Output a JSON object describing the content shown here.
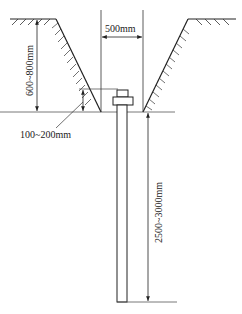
{
  "diagram": {
    "type": "trench-with-pile-cross-section",
    "dimensions": {
      "trench_width": "500mm",
      "trench_depth": "600~800mm",
      "cap_height_above_bottom": "100~200mm",
      "pile_length": "2500~3000mm"
    },
    "colors": {
      "line": "#222222",
      "hatch": "#333333",
      "background": "#ffffff"
    }
  }
}
